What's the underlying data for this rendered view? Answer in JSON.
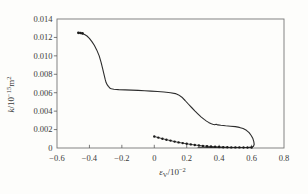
{
  "figure": {
    "bg": "#fdfdfb",
    "frame_color": "#757575",
    "tick_color": "#5a5a5a",
    "line_color": "#2d2d2d",
    "marker_color": "#1c1c1c",
    "text_color": "#3a3a3a"
  },
  "chart_data": {
    "type": "line",
    "title": "",
    "xlabel": "εV/10−2",
    "ylabel": "k/10−15m2",
    "xlabel_parts": [
      {
        "t": "ε",
        "it": true
      },
      {
        "t": "V",
        "sub": true
      },
      {
        "t": "/10"
      },
      {
        "t": "−2",
        "sup": true
      }
    ],
    "ylabel_parts": [
      {
        "t": "k",
        "it": true
      },
      {
        "t": "/10"
      },
      {
        "t": "−15",
        "sup": true
      },
      {
        "t": "m"
      },
      {
        "t": "2",
        "sup": true
      }
    ],
    "xlim": [
      -0.6,
      0.8
    ],
    "ylim": [
      0,
      0.014
    ],
    "grid": false,
    "legend": "none",
    "x_ticks": [
      {
        "v": -0.6,
        "label": "−0.6"
      },
      {
        "v": -0.4,
        "label": "−0.4"
      },
      {
        "v": -0.2,
        "label": "−0.2"
      },
      {
        "v": 0,
        "label": "0"
      },
      {
        "v": 0.2,
        "label": "0.2"
      },
      {
        "v": 0.4,
        "label": "0.4"
      },
      {
        "v": 0.6,
        "label": "0.6"
      },
      {
        "v": 0.8,
        "label": "0.8"
      }
    ],
    "y_ticks": [
      {
        "v": 0,
        "label": "0"
      },
      {
        "v": 0.002,
        "label": "0.002"
      },
      {
        "v": 0.004,
        "label": "0.004"
      },
      {
        "v": 0.006,
        "label": "0.006"
      },
      {
        "v": 0.008,
        "label": "0.008"
      },
      {
        "v": 0.01,
        "label": "0.010"
      },
      {
        "v": 0.012,
        "label": "0.012"
      },
      {
        "v": 0.014,
        "label": "0.014"
      }
    ],
    "series": [
      {
        "name": "permeability-main-curve",
        "marker": "none",
        "line": true,
        "points": [
          [
            -0.47,
            0.0125
          ],
          [
            -0.458,
            0.01248
          ],
          [
            -0.445,
            0.01243
          ],
          [
            -0.43,
            0.01232
          ],
          [
            -0.415,
            0.01215
          ],
          [
            -0.4,
            0.0119
          ],
          [
            -0.385,
            0.01155
          ],
          [
            -0.37,
            0.01115
          ],
          [
            -0.355,
            0.01065
          ],
          [
            -0.34,
            0.01
          ],
          [
            -0.328,
            0.0093
          ],
          [
            -0.318,
            0.0086
          ],
          [
            -0.31,
            0.008
          ],
          [
            -0.303,
            0.00745
          ],
          [
            -0.297,
            0.0071
          ],
          [
            -0.29,
            0.00685
          ],
          [
            -0.283,
            0.00668
          ],
          [
            -0.275,
            0.00652
          ],
          [
            -0.265,
            0.00643
          ],
          [
            -0.25,
            0.00638
          ],
          [
            -0.22,
            0.00634
          ],
          [
            -0.18,
            0.00631
          ],
          [
            -0.14,
            0.00628
          ],
          [
            -0.1,
            0.00625
          ],
          [
            -0.06,
            0.00622
          ],
          [
            -0.02,
            0.00618
          ],
          [
            0.02,
            0.00613
          ],
          [
            0.06,
            0.00608
          ],
          [
            0.1,
            0.006
          ],
          [
            0.13,
            0.0059
          ],
          [
            0.15,
            0.00576
          ],
          [
            0.17,
            0.00551
          ],
          [
            0.19,
            0.00516
          ],
          [
            0.21,
            0.00478
          ],
          [
            0.23,
            0.0044
          ],
          [
            0.25,
            0.00403
          ],
          [
            0.27,
            0.00368
          ],
          [
            0.29,
            0.00335
          ],
          [
            0.308,
            0.0031
          ],
          [
            0.322,
            0.00292
          ],
          [
            0.335,
            0.00278
          ],
          [
            0.348,
            0.00266
          ],
          [
            0.36,
            0.00258
          ],
          [
            0.372,
            0.00253
          ],
          [
            0.382,
            0.00258
          ],
          [
            0.392,
            0.00251
          ],
          [
            0.41,
            0.00246
          ],
          [
            0.44,
            0.00241
          ],
          [
            0.47,
            0.00237
          ],
          [
            0.5,
            0.00232
          ],
          [
            0.525,
            0.00224
          ],
          [
            0.548,
            0.00211
          ],
          [
            0.568,
            0.00192
          ],
          [
            0.585,
            0.00166
          ],
          [
            0.598,
            0.00136
          ],
          [
            0.608,
            0.00102
          ],
          [
            0.614,
            0.00068
          ],
          [
            0.616,
            0.0004
          ],
          [
            0.612,
            0.0002
          ],
          [
            0.603,
            0.0001
          ],
          [
            0.585,
            6e-05
          ],
          [
            0.55,
            5e-05
          ],
          [
            0.5,
            5e-05
          ],
          [
            0.45,
            5e-05
          ],
          [
            0.4,
            6e-05
          ],
          [
            0.35,
            7e-05
          ],
          [
            0.3,
            8e-05
          ],
          [
            0.27,
            9e-05
          ]
        ]
      },
      {
        "name": "loading-branch-dotted-curve",
        "marker": "dot",
        "line": true,
        "points": [
          [
            0.0,
            0.00125
          ],
          [
            0.025,
            0.00113
          ],
          [
            0.05,
            0.00101
          ],
          [
            0.075,
            0.0009
          ],
          [
            0.1,
            0.0008
          ],
          [
            0.125,
            0.0007
          ],
          [
            0.15,
            0.00061
          ],
          [
            0.175,
            0.00053
          ],
          [
            0.2,
            0.00046
          ],
          [
            0.225,
            0.00039
          ],
          [
            0.25,
            0.00033
          ],
          [
            0.275,
            0.00028
          ],
          [
            0.3,
            0.00023
          ],
          [
            0.325,
            0.00019
          ],
          [
            0.35,
            0.00016
          ],
          [
            0.375,
            0.00013
          ],
          [
            0.4,
            0.00011
          ],
          [
            0.425,
            9e-05
          ],
          [
            0.45,
            8e-05
          ],
          [
            0.475,
            7e-05
          ],
          [
            0.5,
            6e-05
          ],
          [
            0.525,
            6e-05
          ],
          [
            0.55,
            5e-05
          ],
          [
            0.575,
            5e-05
          ],
          [
            0.6,
            5e-05
          ]
        ]
      },
      {
        "name": "curve-start-markers",
        "marker": "dot",
        "line": false,
        "points": [
          [
            -0.468,
            0.0125
          ],
          [
            -0.455,
            0.01248
          ],
          [
            -0.443,
            0.01244
          ]
        ]
      }
    ]
  }
}
